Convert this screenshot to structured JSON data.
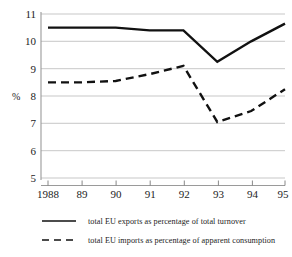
{
  "chart_data": {
    "type": "line",
    "title": "",
    "subtitle": "",
    "xlabel": "",
    "ylabel": "%",
    "x": [
      "1988",
      "89",
      "90",
      "91",
      "92",
      "93",
      "94",
      "95"
    ],
    "xtick_labels": [
      "1988",
      "89",
      "90",
      "91",
      "92",
      "93",
      "94",
      "95"
    ],
    "ytick_labels": [
      "11",
      "10",
      "9",
      "8",
      "7",
      "6",
      "5"
    ],
    "ytick_values": [
      11,
      10,
      9,
      8,
      7,
      6,
      5
    ],
    "ylim": [
      5,
      11
    ],
    "grid": "horizontal",
    "legend_position": "below",
    "series": [
      {
        "name": "total EU exports as percentage of total turnover",
        "style": "solid",
        "color": "#111111",
        "values": [
          10.5,
          10.5,
          10.5,
          10.4,
          10.4,
          9.25,
          10.0,
          10.65
        ]
      },
      {
        "name": "total EU imports as percentage of apparent consumption",
        "style": "dashed",
        "color": "#111111",
        "values": [
          8.5,
          8.5,
          8.55,
          8.8,
          9.1,
          7.05,
          7.45,
          8.25
        ]
      }
    ],
    "annotations": []
  },
  "legend": {
    "items": [
      {
        "label": "total EU exports as percentage of total turnover",
        "style": "solid",
        "swatch": "solid-line-swatch"
      },
      {
        "label": "total EU imports as percentage of apparent consumption",
        "style": "dashed",
        "swatch": "dashed-line-swatch"
      }
    ]
  },
  "axes": {
    "y_unit_label": "%",
    "y_labels": [
      "11",
      "10",
      "9",
      "8",
      "7",
      "6",
      "5"
    ],
    "x_labels": [
      "1988",
      "89",
      "90",
      "91",
      "92",
      "93",
      "94",
      "95"
    ]
  },
  "colors": {
    "line": "#111111",
    "grid": "#b9b9b9",
    "axis": "#9a9a9a",
    "background": "#ffffff",
    "text": "#1c1c1c"
  }
}
